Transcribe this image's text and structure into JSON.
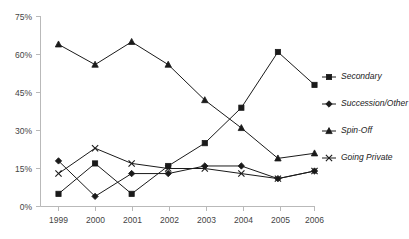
{
  "chart_data": {
    "type": "line",
    "title": "",
    "subtitle": "",
    "xlabel": "",
    "ylabel": "",
    "categories": [
      "1999",
      "2000",
      "2001",
      "2002",
      "2003",
      "2004",
      "2005",
      "2006"
    ],
    "x_tick_labels": [
      "1999",
      "2000",
      "2001",
      "2002",
      "2003",
      "2004",
      "2005",
      "2006"
    ],
    "y_tick_labels": [
      "0%",
      "15%",
      "30%",
      "45%",
      "60%",
      "75%"
    ],
    "y_tick_values": [
      0,
      15,
      30,
      45,
      60,
      75
    ],
    "ylim": [
      0,
      75
    ],
    "grid": false,
    "legend_position": "right",
    "units": "percent",
    "series": [
      {
        "name": "Secondary",
        "marker": "square",
        "color": "#1a1a1a",
        "values": [
          5,
          17,
          5,
          16,
          25,
          39,
          61,
          48
        ]
      },
      {
        "name": "Succession/Other",
        "marker": "diamond",
        "color": "#1a1a1a",
        "values": [
          18,
          4,
          13,
          13,
          16,
          16,
          11,
          14
        ]
      },
      {
        "name": "Spin-Off",
        "marker": "triangle",
        "color": "#1a1a1a",
        "values": [
          64,
          56,
          65,
          56,
          42,
          31,
          19,
          21
        ]
      },
      {
        "name": "Going Private",
        "marker": "x",
        "color": "#1a1a1a",
        "values": [
          13,
          23,
          17,
          15,
          15,
          13,
          11,
          14
        ]
      }
    ]
  },
  "legend": {
    "entries": [
      {
        "label": "Secondary",
        "marker": "square"
      },
      {
        "label": "Succession/Other",
        "marker": "diamond"
      },
      {
        "label": "Spin-Off",
        "marker": "triangle"
      },
      {
        "label": "Going Private",
        "marker": "x"
      }
    ]
  },
  "axes": {
    "y": {
      "labels": [
        "75%",
        "60%",
        "45%",
        "30%",
        "15%",
        "0%"
      ]
    },
    "x": {
      "labels": [
        "1999",
        "2000",
        "2001",
        "2002",
        "2003",
        "2004",
        "2005",
        "2006"
      ]
    }
  },
  "colors": {
    "ink": "#1a1a1a",
    "axis": "#b9b9b9",
    "tick_text": "#444444",
    "background": "#ffffff"
  }
}
